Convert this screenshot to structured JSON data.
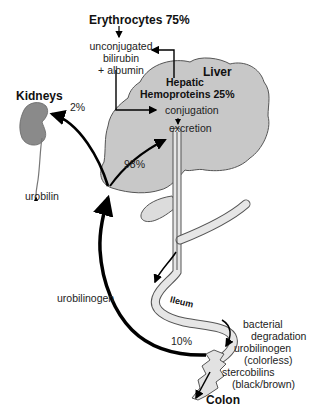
{
  "diagram": {
    "sources": {
      "erythrocytes": "Erythrocytes 75%",
      "hepatic_line1": "Hepatic",
      "hepatic_line2": "Hemoproteins 25%"
    },
    "bilirubin": {
      "line1": "unconjugated",
      "line2": "bilirubin",
      "line3": "+ albumin"
    },
    "organs": {
      "liver": "Liver",
      "kidneys": "Kidneys",
      "colon": "Colon",
      "ileum": "Ileum"
    },
    "liver_steps": {
      "conjugation": "conjugation",
      "excretion": "excretion"
    },
    "percentages": {
      "kidney": "2%",
      "liver_return": "98%",
      "reabsorbed": "10%"
    },
    "products": {
      "urobilin": "urobilin",
      "urobilinogen_return": "urobilinogen",
      "bacterial_line1": "bacterial",
      "bacterial_line2": "degradation",
      "urobilinogen_colon": "urobilinogen",
      "colorless": "(colorless)",
      "stercobilins": "stercobilins",
      "black_brown": "(black/brown)"
    },
    "colors": {
      "organ_fill": "#c8c8c8",
      "kidney_fill": "#8a8a8a",
      "intestine_fill": "#e6e6e6",
      "outline": "#555555",
      "arrow": "#000000"
    }
  }
}
